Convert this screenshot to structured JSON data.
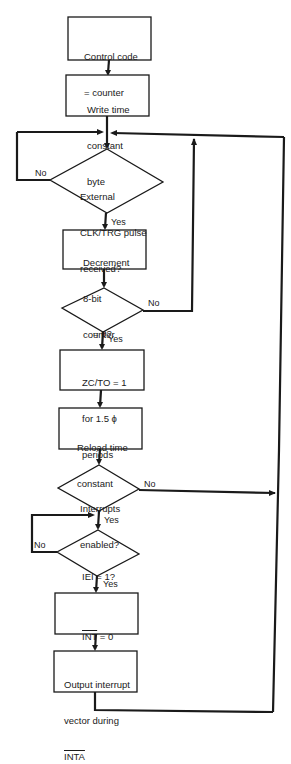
{
  "flowchart": {
    "nodes": [
      {
        "id": "n1",
        "type": "process",
        "lines": [
          "Control code",
          "= counter"
        ]
      },
      {
        "id": "n2",
        "type": "process",
        "lines": [
          "Write time",
          "constant",
          "byte"
        ]
      },
      {
        "id": "d1",
        "type": "decision",
        "lines": [
          "External",
          "CLK/TRG pulse",
          "received?"
        ]
      },
      {
        "id": "n3",
        "type": "process",
        "lines": [
          "Decrement",
          "8-bit",
          "counter"
        ]
      },
      {
        "id": "d2",
        "type": "decision",
        "lines": [
          "= 0?"
        ]
      },
      {
        "id": "n4",
        "type": "process",
        "lines": [
          "ZC/TO = 1",
          "for 1.5 ϕ",
          "periods"
        ]
      },
      {
        "id": "n5",
        "type": "process",
        "lines": [
          "Reload time",
          "constant"
        ]
      },
      {
        "id": "d3",
        "type": "decision",
        "lines": [
          "Interrupts",
          "enabled?"
        ]
      },
      {
        "id": "d4",
        "type": "decision",
        "lines": [
          "IEI = 1?"
        ]
      },
      {
        "id": "n6",
        "type": "process",
        "lines": [
          "INT = 0"
        ],
        "overline": "INT"
      },
      {
        "id": "n7",
        "type": "process",
        "lines": [
          "Output interrupt",
          "vector during",
          "INTA"
        ],
        "overline": "INTA"
      }
    ],
    "labels": {
      "d1_no": "No",
      "d1_yes": "Yes",
      "d2_no": "No",
      "d2_yes": "Yes",
      "d3_no": "No",
      "d3_yes": "Yes",
      "d4_no": "No",
      "d4_yes": "Yes"
    },
    "edges": [
      {
        "from": "n1",
        "to": "n2"
      },
      {
        "from": "n2",
        "to": "d1"
      },
      {
        "from": "d1",
        "to": "n3",
        "label": "Yes"
      },
      {
        "from": "d1",
        "to": "d1",
        "label": "No"
      },
      {
        "from": "n3",
        "to": "d2"
      },
      {
        "from": "d2",
        "to": "n4",
        "label": "Yes"
      },
      {
        "from": "d2",
        "to": "d1",
        "label": "No"
      },
      {
        "from": "n4",
        "to": "n5"
      },
      {
        "from": "n5",
        "to": "d3"
      },
      {
        "from": "d3",
        "to": "d4",
        "label": "Yes"
      },
      {
        "from": "d3",
        "to": "d1",
        "label": "No"
      },
      {
        "from": "d4",
        "to": "n6",
        "label": "Yes"
      },
      {
        "from": "d4",
        "to": "d4",
        "label": "No"
      },
      {
        "from": "n6",
        "to": "n7"
      },
      {
        "from": "n7",
        "to": "d1"
      }
    ],
    "colors": {
      "ink": "#1a1a1a",
      "paper": "#ffffff"
    }
  }
}
